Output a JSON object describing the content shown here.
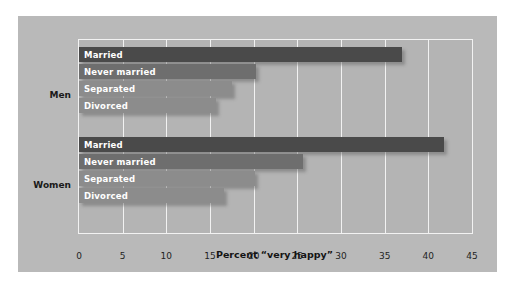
{
  "chart_data": {
    "type": "bar",
    "orientation": "horizontal",
    "title": "",
    "xlabel": "Percent “very happy”",
    "ylabel": "",
    "xlim": [
      0,
      45
    ],
    "xticks": [
      0,
      5,
      10,
      15,
      20,
      25,
      30,
      35,
      40,
      45
    ],
    "xtick_labels": [
      "0",
      "5",
      "10",
      "15",
      "20",
      "25",
      "30",
      "35",
      "40",
      "45"
    ],
    "grid": "vertical",
    "legend": "none",
    "categories": [
      "Married",
      "Never married",
      "Separated",
      "Divorced"
    ],
    "groups": [
      "Men",
      "Women"
    ],
    "series": [
      {
        "name": "Men",
        "bars": [
          {
            "label": "Married",
            "value": 37.0,
            "color": "#4a4a4a"
          },
          {
            "label": "Never married",
            "value": 20.3,
            "color": "#6e6e6e"
          },
          {
            "label": "Separated",
            "value": 17.5,
            "color": "#8c8c8c"
          },
          {
            "label": "Divorced",
            "value": 15.7,
            "color": "#8c8c8c"
          }
        ]
      },
      {
        "name": "Women",
        "bars": [
          {
            "label": "Married",
            "value": 41.8,
            "color": "#4a4a4a"
          },
          {
            "label": "Never married",
            "value": 25.6,
            "color": "#6e6e6e"
          },
          {
            "label": "Separated",
            "value": 20.2,
            "color": "#8c8c8c"
          },
          {
            "label": "Divorced",
            "value": 16.6,
            "color": "#8c8c8c"
          }
        ]
      }
    ]
  },
  "figure": {
    "panel_color": "#b9b9b9",
    "plot_color": "#b4b4b4",
    "grid_color": "#f2f2f2",
    "page_color": "#ffffff"
  }
}
